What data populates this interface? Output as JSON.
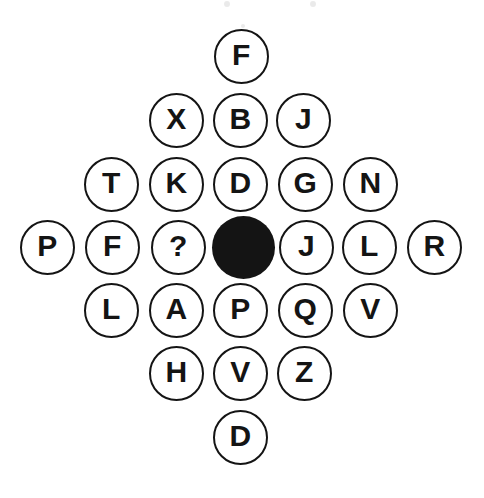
{
  "diagram": {
    "background_color": "#ffffff",
    "outline_color": "#141414",
    "fill_color": "#141414",
    "text_color": "#141414",
    "circle_diameter": 55,
    "filled_circle_diameter": 63,
    "rows": [
      {
        "index": 1,
        "nodes": [
          {
            "label": "F",
            "state": "open",
            "cx": 241,
            "cy": 56
          }
        ]
      },
      {
        "index": 2,
        "nodes": [
          {
            "label": "X",
            "state": "open",
            "cx": 176,
            "cy": 120
          },
          {
            "label": "B",
            "state": "open",
            "cx": 240,
            "cy": 120
          },
          {
            "label": "J",
            "state": "open",
            "cx": 303,
            "cy": 120
          }
        ]
      },
      {
        "index": 3,
        "nodes": [
          {
            "label": "T",
            "state": "open",
            "cx": 111,
            "cy": 184
          },
          {
            "label": "K",
            "state": "open",
            "cx": 176,
            "cy": 184
          },
          {
            "label": "D",
            "state": "open",
            "cx": 240,
            "cy": 184
          },
          {
            "label": "G",
            "state": "open",
            "cx": 305,
            "cy": 184
          },
          {
            "label": "N",
            "state": "open",
            "cx": 370,
            "cy": 184
          }
        ]
      },
      {
        "index": 4,
        "nodes": [
          {
            "label": "P",
            "state": "open",
            "cx": 47,
            "cy": 247
          },
          {
            "label": "F",
            "state": "open",
            "cx": 112,
            "cy": 247
          },
          {
            "label": "?",
            "state": "open",
            "cx": 178,
            "cy": 247
          },
          {
            "label": "",
            "state": "filled",
            "cx": 243,
            "cy": 247
          },
          {
            "label": "J",
            "state": "open",
            "cx": 306,
            "cy": 247
          },
          {
            "label": "L",
            "state": "open",
            "cx": 369,
            "cy": 247
          },
          {
            "label": "R",
            "state": "open",
            "cx": 434,
            "cy": 247
          }
        ]
      },
      {
        "index": 5,
        "nodes": [
          {
            "label": "L",
            "state": "open",
            "cx": 111,
            "cy": 310
          },
          {
            "label": "A",
            "state": "open",
            "cx": 176,
            "cy": 310
          },
          {
            "label": "P",
            "state": "open",
            "cx": 240,
            "cy": 310
          },
          {
            "label": "Q",
            "state": "open",
            "cx": 305,
            "cy": 310
          },
          {
            "label": "V",
            "state": "open",
            "cx": 370,
            "cy": 310
          }
        ]
      },
      {
        "index": 6,
        "nodes": [
          {
            "label": "H",
            "state": "open",
            "cx": 176,
            "cy": 373
          },
          {
            "label": "V",
            "state": "open",
            "cx": 240,
            "cy": 373
          },
          {
            "label": "Z",
            "state": "open",
            "cx": 304,
            "cy": 373
          }
        ]
      },
      {
        "index": 7,
        "nodes": [
          {
            "label": "D",
            "state": "open",
            "cx": 240,
            "cy": 437
          }
        ]
      }
    ],
    "specks": [
      {
        "cx": 227,
        "cy": 4,
        "r": 3
      },
      {
        "cx": 313,
        "cy": 4,
        "r": 3
      },
      {
        "cx": 243,
        "cy": 26,
        "r": 2
      }
    ]
  }
}
